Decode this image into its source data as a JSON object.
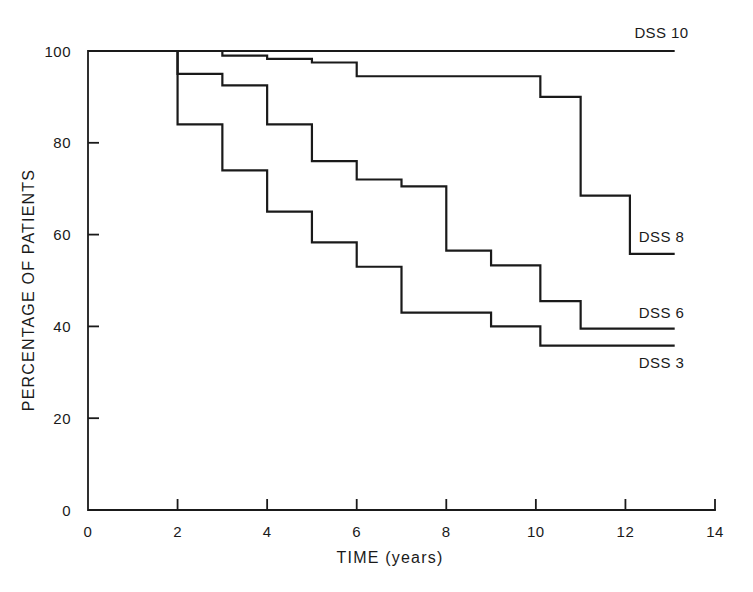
{
  "chart_data": {
    "type": "line",
    "subtype": "kaplan-meier-step",
    "title": "",
    "xlabel": "TIME (years)",
    "ylabel": "PERCENTAGE OF PATIENTS",
    "xlim": [
      0,
      14
    ],
    "ylim": [
      0,
      100
    ],
    "xticks": [
      0,
      2,
      4,
      6,
      8,
      10,
      12,
      14
    ],
    "xticklabels": [
      "0",
      "2",
      "4",
      "6",
      "8",
      "10",
      "12",
      "14"
    ],
    "yticks": [
      0,
      20,
      40,
      60,
      80,
      100
    ],
    "yticklabels": [
      "0",
      "20",
      "40",
      "60",
      "80",
      "100"
    ],
    "grid": false,
    "legend_position": "inline-right-of-curve-ends",
    "series": [
      {
        "name": "DSS 10",
        "label": "DSS 10",
        "label_x": 12.2,
        "label_y": 104,
        "steps": [
          {
            "x": 0,
            "y": 100
          },
          {
            "x": 13.1,
            "y": 100
          }
        ]
      },
      {
        "name": "DSS 8",
        "label": "DSS 8",
        "label_x": 12.3,
        "label_y": 59.5,
        "steps": [
          {
            "x": 0,
            "y": 100
          },
          {
            "x": 3.0,
            "y": 100
          },
          {
            "x": 3.0,
            "y": 99.0
          },
          {
            "x": 4.0,
            "y": 99.0
          },
          {
            "x": 4.0,
            "y": 98.3
          },
          {
            "x": 5.0,
            "y": 98.3
          },
          {
            "x": 5.0,
            "y": 97.5
          },
          {
            "x": 6.0,
            "y": 97.5
          },
          {
            "x": 6.0,
            "y": 94.5
          },
          {
            "x": 10.1,
            "y": 94.5
          },
          {
            "x": 10.1,
            "y": 90.0
          },
          {
            "x": 11.0,
            "y": 90.0
          },
          {
            "x": 11.0,
            "y": 68.5
          },
          {
            "x": 12.1,
            "y": 68.5
          },
          {
            "x": 12.1,
            "y": 55.8
          },
          {
            "x": 13.1,
            "y": 55.8
          }
        ]
      },
      {
        "name": "DSS 6",
        "label": "DSS 6",
        "label_x": 12.3,
        "label_y": 43.0,
        "steps": [
          {
            "x": 0,
            "y": 100
          },
          {
            "x": 2.0,
            "y": 100
          },
          {
            "x": 2.0,
            "y": 95.0
          },
          {
            "x": 3.0,
            "y": 95.0
          },
          {
            "x": 3.0,
            "y": 92.5
          },
          {
            "x": 4.0,
            "y": 92.5
          },
          {
            "x": 4.0,
            "y": 84.0
          },
          {
            "x": 5.0,
            "y": 84.0
          },
          {
            "x": 5.0,
            "y": 76.0
          },
          {
            "x": 6.0,
            "y": 76.0
          },
          {
            "x": 6.0,
            "y": 72.0
          },
          {
            "x": 7.0,
            "y": 72.0
          },
          {
            "x": 7.0,
            "y": 70.5
          },
          {
            "x": 8.0,
            "y": 70.5
          },
          {
            "x": 8.0,
            "y": 56.5
          },
          {
            "x": 9.0,
            "y": 56.5
          },
          {
            "x": 9.0,
            "y": 53.3
          },
          {
            "x": 10.1,
            "y": 53.3
          },
          {
            "x": 10.1,
            "y": 45.5
          },
          {
            "x": 11.0,
            "y": 45.5
          },
          {
            "x": 11.0,
            "y": 39.5
          },
          {
            "x": 13.1,
            "y": 39.5
          }
        ]
      },
      {
        "name": "DSS 3",
        "label": "DSS 3",
        "label_x": 12.3,
        "label_y": 32.0,
        "steps": [
          {
            "x": 0,
            "y": 100
          },
          {
            "x": 2.0,
            "y": 100
          },
          {
            "x": 2.0,
            "y": 84.0
          },
          {
            "x": 3.0,
            "y": 84.0
          },
          {
            "x": 3.0,
            "y": 74.0
          },
          {
            "x": 4.0,
            "y": 74.0
          },
          {
            "x": 4.0,
            "y": 65.0
          },
          {
            "x": 5.0,
            "y": 65.0
          },
          {
            "x": 5.0,
            "y": 58.3
          },
          {
            "x": 6.0,
            "y": 58.3
          },
          {
            "x": 6.0,
            "y": 53.0
          },
          {
            "x": 7.0,
            "y": 53.0
          },
          {
            "x": 7.0,
            "y": 43.0
          },
          {
            "x": 9.0,
            "y": 43.0
          },
          {
            "x": 9.0,
            "y": 40.0
          },
          {
            "x": 10.1,
            "y": 40.0
          },
          {
            "x": 10.1,
            "y": 35.8
          },
          {
            "x": 13.1,
            "y": 35.8
          }
        ]
      }
    ]
  },
  "axes": {
    "x_title": "TIME (years)",
    "y_title": "PERCENTAGE OF PATIENTS"
  },
  "labels": {
    "dss10": "DSS 10",
    "dss8": "DSS 8",
    "dss6": "DSS 6",
    "dss3": "DSS 3"
  },
  "colors": {
    "ink": "#1a1a1a",
    "background": "#ffffff"
  }
}
